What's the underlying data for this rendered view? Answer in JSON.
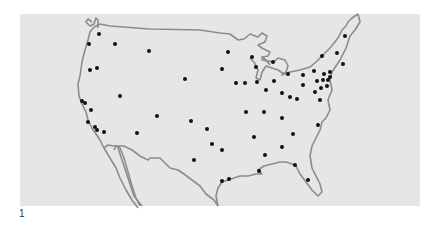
{
  "figure": {
    "label": "1"
  },
  "colors": {
    "background": "#ffffff",
    "panel": "#e6e6e6",
    "outline": "#8c8c8c",
    "dot": "#111111",
    "label": "#333333"
  },
  "map": {
    "region": "Continental United States",
    "dot_count": 72,
    "dots": [
      [
        99,
        34
      ],
      [
        89,
        44
      ],
      [
        115,
        44
      ],
      [
        149,
        51
      ],
      [
        90,
        70
      ],
      [
        97,
        68
      ],
      [
        185,
        79
      ],
      [
        82,
        101
      ],
      [
        85,
        103
      ],
      [
        91,
        110
      ],
      [
        88,
        122
      ],
      [
        95,
        127
      ],
      [
        97,
        130
      ],
      [
        104,
        132
      ],
      [
        120,
        96
      ],
      [
        157,
        116
      ],
      [
        137,
        133
      ],
      [
        228,
        52
      ],
      [
        222,
        69
      ],
      [
        236,
        83
      ],
      [
        252,
        57
      ],
      [
        256,
        67
      ],
      [
        257,
        82
      ],
      [
        274,
        81
      ],
      [
        266,
        90
      ],
      [
        282,
        93
      ],
      [
        290,
        97
      ],
      [
        345,
        36
      ],
      [
        337,
        53
      ],
      [
        322,
        56
      ],
      [
        343,
        64
      ],
      [
        314,
        71
      ],
      [
        330,
        72
      ],
      [
        324,
        74
      ],
      [
        330,
        77
      ],
      [
        303,
        75
      ],
      [
        317,
        81
      ],
      [
        323,
        80
      ],
      [
        328,
        80
      ],
      [
        327,
        86
      ],
      [
        321,
        88
      ],
      [
        303,
        85
      ],
      [
        315,
        92
      ],
      [
        297,
        99
      ],
      [
        320,
        100
      ],
      [
        191,
        121
      ],
      [
        207,
        129
      ],
      [
        212,
        144
      ],
      [
        222,
        150
      ],
      [
        194,
        160
      ],
      [
        246,
        112
      ],
      [
        264,
        112
      ],
      [
        282,
        118
      ],
      [
        254,
        137
      ],
      [
        293,
        134
      ],
      [
        282,
        147
      ],
      [
        265,
        155
      ],
      [
        295,
        165
      ],
      [
        259,
        171
      ],
      [
        229,
        179
      ],
      [
        222,
        181
      ],
      [
        308,
        180
      ],
      [
        318,
        125
      ],
      [
        245,
        83
      ],
      [
        273,
        62
      ],
      [
        288,
        74
      ]
    ]
  }
}
